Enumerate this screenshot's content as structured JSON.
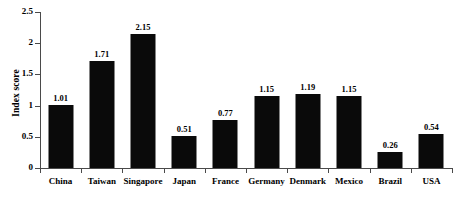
{
  "chart_data": {
    "type": "bar",
    "title": "",
    "subtitle": "",
    "xlabel": "",
    "ylabel": "Index score",
    "ylim": [
      0,
      2.5
    ],
    "yticks": [
      "0",
      "0.5",
      "1",
      "1.5",
      "2",
      "2.5"
    ],
    "ytick_values": [
      0,
      0.5,
      1,
      1.5,
      2,
      2.5
    ],
    "grid": false,
    "legend": null,
    "bar_color": "#0a0a0a",
    "axis_color": "#4a4a4a",
    "background_color": "#ffffff",
    "categories": [
      "China",
      "Taiwan",
      "Singapore",
      "Japan",
      "France",
      "Germany",
      "Denmark",
      "Mexico",
      "Brazil",
      "USA"
    ],
    "values": [
      1.01,
      1.71,
      2.15,
      0.51,
      0.77,
      1.15,
      1.19,
      1.15,
      0.26,
      0.54
    ],
    "value_labels": [
      "1.01",
      "1.71",
      "2.15",
      "0.51",
      "0.77",
      "1.15",
      "1.19",
      "1.15",
      "0.26",
      "0.54"
    ]
  }
}
